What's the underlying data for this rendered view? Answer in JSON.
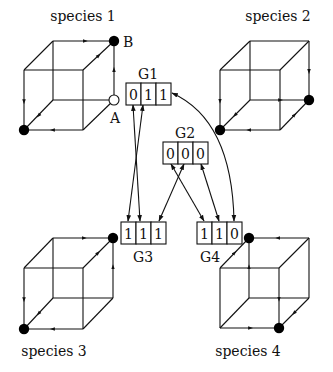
{
  "species": [
    {
      "name": "species 1",
      "label_pos": [
        83,
        21
      ],
      "cube": {
        "btl": [
          53,
          41
        ],
        "btr": [
          114,
          41
        ],
        "bbl": [
          53,
          100
        ],
        "bbr": [
          114,
          100
        ],
        "ftl": [
          24,
          70
        ],
        "ftr": [
          83,
          70
        ],
        "fbl": [
          24,
          130
        ],
        "fbr": [
          83,
          130
        ]
      },
      "filled_nodes": [
        [
          114,
          41
        ],
        [
          24,
          130
        ]
      ],
      "open_nodes": [
        [
          114,
          100
        ]
      ],
      "point_labels": [
        {
          "text": "B",
          "pos": [
            123,
            47
          ]
        },
        {
          "text": "A",
          "pos": [
            110,
            123
          ]
        }
      ],
      "arrows": [
        {
          "from": [
            53,
            41
          ],
          "to": [
            108,
            41
          ]
        },
        {
          "from": [
            114,
            100
          ],
          "to": [
            114,
            48
          ]
        },
        {
          "from": [
            83,
            70
          ],
          "to": [
            109,
            46
          ]
        },
        {
          "from": [
            24,
            70
          ],
          "to": [
            24,
            124
          ]
        },
        {
          "from": [
            83,
            130
          ],
          "to": [
            31,
            130
          ]
        },
        {
          "from": [
            53,
            100
          ],
          "to": [
            29,
            126
          ]
        }
      ]
    },
    {
      "name": "species 2",
      "label_pos": [
        278,
        21
      ],
      "cube": {
        "btl": [
          250,
          41
        ],
        "btr": [
          309,
          41
        ],
        "bbl": [
          250,
          100
        ],
        "bbr": [
          309,
          100
        ],
        "ftl": [
          220,
          70
        ],
        "ftr": [
          280,
          70
        ],
        "fbl": [
          220,
          130
        ],
        "fbr": [
          280,
          130
        ]
      },
      "filled_nodes": [
        [
          309,
          100
        ],
        [
          220,
          130
        ]
      ],
      "open_nodes": [],
      "point_labels": [],
      "arrows": [
        {
          "from": [
            309,
            41
          ],
          "to": [
            309,
            93
          ]
        },
        {
          "from": [
            250,
            100
          ],
          "to": [
            302,
            100
          ]
        },
        {
          "from": [
            280,
            130
          ],
          "to": [
            304,
            105
          ]
        },
        {
          "from": [
            220,
            70
          ],
          "to": [
            220,
            123
          ]
        },
        {
          "from": [
            280,
            130
          ],
          "to": [
            227,
            130
          ]
        },
        {
          "from": [
            250,
            100
          ],
          "to": [
            225,
            125
          ]
        }
      ]
    },
    {
      "name": "species 3",
      "label_pos": [
        54,
        356
      ],
      "cube": {
        "btl": [
          53,
          238
        ],
        "btr": [
          113,
          238
        ],
        "bbl": [
          53,
          298
        ],
        "bbr": [
          113,
          298
        ],
        "ftl": [
          24,
          268
        ],
        "ftr": [
          83,
          268
        ],
        "fbl": [
          24,
          329
        ],
        "fbr": [
          83,
          329
        ]
      },
      "filled_nodes": [
        [
          113,
          238
        ],
        [
          24,
          329
        ]
      ],
      "open_nodes": [],
      "point_labels": [],
      "arrows": [
        {
          "from": [
            53,
            238
          ],
          "to": [
            106,
            238
          ]
        },
        {
          "from": [
            113,
            298
          ],
          "to": [
            113,
            245
          ]
        },
        {
          "from": [
            83,
            268
          ],
          "to": [
            108,
            243
          ]
        },
        {
          "from": [
            24,
            268
          ],
          "to": [
            24,
            322
          ]
        },
        {
          "from": [
            83,
            329
          ],
          "to": [
            31,
            329
          ]
        },
        {
          "from": [
            53,
            298
          ],
          "to": [
            29,
            324
          ]
        }
      ]
    },
    {
      "name": "species 4",
      "label_pos": [
        248,
        356
      ],
      "cube": {
        "btl": [
          249,
          238
        ],
        "btr": [
          309,
          238
        ],
        "bbl": [
          249,
          298
        ],
        "bbr": [
          309,
          298
        ],
        "ftl": [
          220,
          268
        ],
        "ftr": [
          279,
          268
        ],
        "fbl": [
          220,
          328
        ],
        "fbr": [
          279,
          328
        ]
      },
      "filled_nodes": [
        [
          249,
          238
        ],
        [
          279,
          328
        ]
      ],
      "open_nodes": [],
      "point_labels": [],
      "arrows": [
        {
          "from": [
            309,
            238
          ],
          "to": [
            256,
            238
          ]
        },
        {
          "from": [
            249,
            298
          ],
          "to": [
            249,
            245
          ]
        },
        {
          "from": [
            220,
            268
          ],
          "to": [
            244,
            243
          ]
        },
        {
          "from": [
            279,
            268
          ],
          "to": [
            279,
            321
          ]
        },
        {
          "from": [
            220,
            328
          ],
          "to": [
            272,
            328
          ]
        },
        {
          "from": [
            309,
            298
          ],
          "to": [
            284,
            323
          ]
        }
      ]
    }
  ],
  "genes": [
    {
      "name": "G1",
      "values": [
        "0",
        "1",
        "1"
      ],
      "box": [
        126,
        83
      ],
      "label_pos": [
        148,
        79
      ]
    },
    {
      "name": "G2",
      "values": [
        "0",
        "0",
        "0"
      ],
      "box": [
        163,
        142
      ],
      "label_pos": [
        185,
        138
      ]
    },
    {
      "name": "G3",
      "values": [
        "1",
        "1",
        "1"
      ],
      "box": [
        121,
        222
      ],
      "label_pos": [
        143,
        262
      ]
    },
    {
      "name": "G4",
      "values": [
        "1",
        "1",
        "0"
      ],
      "box": [
        197,
        222
      ],
      "label_pos": [
        210,
        262
      ]
    }
  ],
  "cell": {
    "width": 15,
    "height": 22
  },
  "links": [
    {
      "from": [
        133,
        105
      ],
      "to": [
        140,
        221
      ],
      "type": "line"
    },
    {
      "from": [
        143,
        105
      ],
      "to": [
        128,
        221
      ],
      "type": "line"
    },
    {
      "from": [
        171,
        164
      ],
      "to": [
        204,
        221
      ],
      "type": "line"
    },
    {
      "from": [
        184,
        164
      ],
      "to": [
        159,
        221
      ],
      "type": "line"
    },
    {
      "from": [
        201,
        164
      ],
      "to": [
        219,
        221
      ],
      "type": "line"
    },
    {
      "from": [
        172,
        93
      ],
      "to": [
        234,
        221
      ],
      "type": "arc",
      "ctrl": [
        232,
        120
      ]
    }
  ]
}
